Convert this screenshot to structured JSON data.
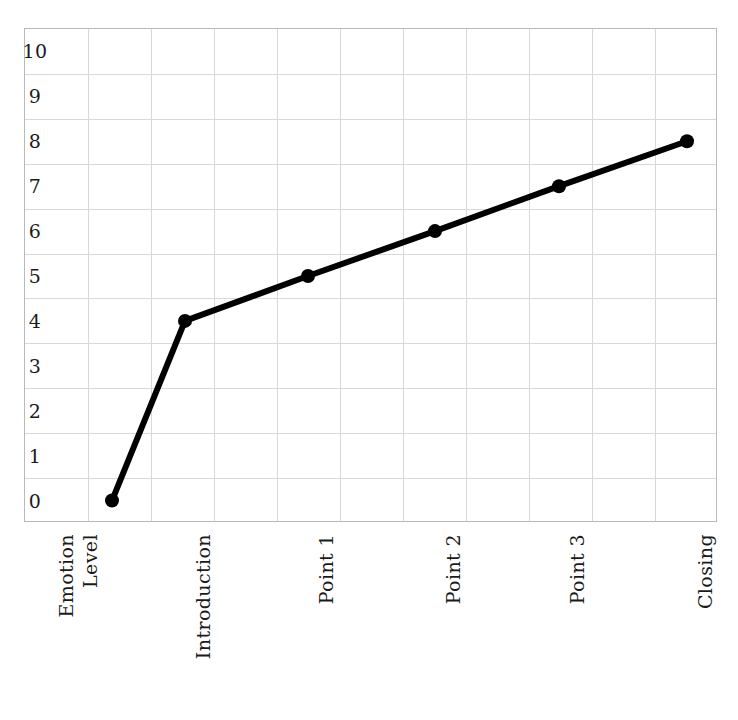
{
  "chart_data": {
    "type": "line",
    "title": "",
    "xlabel": "",
    "ylabel": "Emotion Level",
    "ylabel_lines": [
      "Emotion",
      "Level"
    ],
    "categories": [
      "Introduction",
      "Point 1",
      "Point 2",
      "Point 3",
      "Closing"
    ],
    "series": [
      {
        "name": "Emotion Level",
        "values": [
          4,
          5,
          6,
          7,
          8
        ]
      }
    ],
    "origin_point": {
      "label": "",
      "value": 0
    },
    "plotted_points": [
      {
        "x_index": 0,
        "label": "",
        "value": 0
      },
      {
        "x_index": 1,
        "label": "Introduction",
        "value": 4
      },
      {
        "x_index": 2,
        "label": "Point 1",
        "value": 5
      },
      {
        "x_index": 3,
        "label": "Point 2",
        "value": 6
      },
      {
        "x_index": 4,
        "label": "Point 3",
        "value": 7
      },
      {
        "x_index": 5,
        "label": "Closing",
        "value": 8
      }
    ],
    "y_ticks": [
      10,
      9,
      8,
      7,
      6,
      5,
      4,
      3,
      2,
      1,
      0
    ],
    "ylim": [
      0,
      10
    ],
    "grid": true,
    "legend": false,
    "legend_position": "none",
    "colors": {
      "line": "#000000",
      "marker": "#000000",
      "grid": "#d8d8d8",
      "frame": "#b9b9b9",
      "background": "#ffffff",
      "text": "#1a1a1a"
    },
    "line_width_px": 6,
    "marker_radius_px": 7
  },
  "axis": {
    "y_tick_labels": [
      "10",
      "9",
      "8",
      "7",
      "6",
      "5",
      "4",
      "3",
      "2",
      "1",
      "0"
    ],
    "x_tick_labels": [
      "Introduction",
      "Point 1",
      "Point 2",
      "Point 3",
      "Closing"
    ],
    "y_title_line_1": "Emotion",
    "y_title_line_2": "Level"
  }
}
